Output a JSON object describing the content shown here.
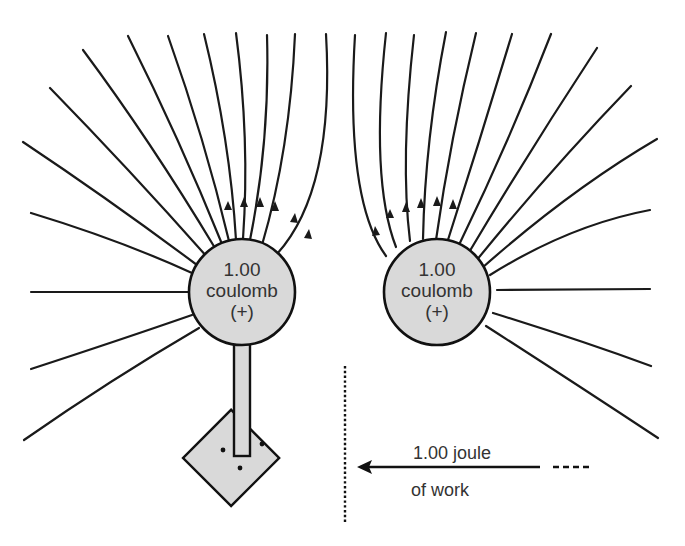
{
  "diagram": {
    "left_charge": {
      "value": "1.00",
      "unit": "coulomb",
      "sign": "(+)"
    },
    "right_charge": {
      "value": "1.00",
      "unit": "coulomb",
      "sign": "(+)"
    },
    "work_label": {
      "line1": "1.00 joule",
      "line2": "of work"
    },
    "colors": {
      "charge_fill": "#d9d9d9",
      "line": "#1a1a1a",
      "text": "#333333"
    }
  }
}
